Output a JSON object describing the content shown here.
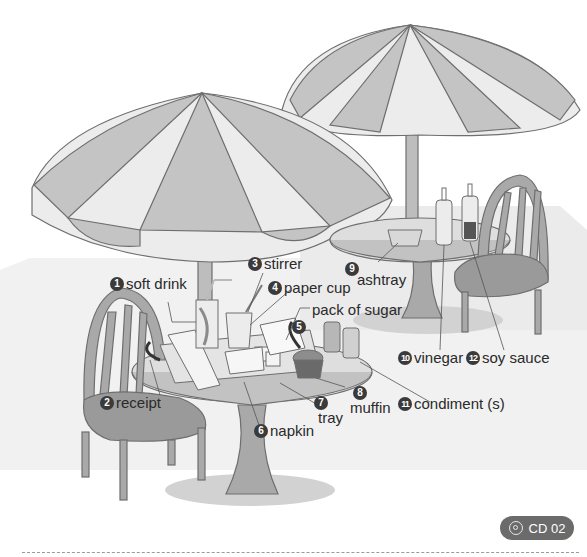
{
  "illustration": {
    "subject": "outdoor cafe tables with umbrellas",
    "colors": {
      "umbrella_dark": "#c4c4c4",
      "umbrella_light": "#ececec",
      "outline": "#6e6e6e",
      "furniture": "#a9a9a9",
      "seat": "#9a9a9a",
      "ground_band": "#eeeeee",
      "shadow": "#cfcfcf",
      "badge": "#6b6b6b"
    }
  },
  "labels": [
    {
      "number": "1",
      "text": "soft drink"
    },
    {
      "number": "2",
      "text": "receipt"
    },
    {
      "number": "3",
      "text": "stirrer"
    },
    {
      "number": "4",
      "text": "paper cup"
    },
    {
      "number": "5",
      "text": "pack of sugar"
    },
    {
      "number": "6",
      "text": "napkin"
    },
    {
      "number": "7",
      "text": "tray"
    },
    {
      "number": "8",
      "text": "muffin"
    },
    {
      "number": "9",
      "text": "ashtray"
    },
    {
      "number": "10",
      "text": "vinegar"
    },
    {
      "number": "11",
      "text": "condiment (s)"
    },
    {
      "number": "12",
      "text": "soy sauce"
    }
  ],
  "audio_badge": {
    "icon": "cd-icon",
    "text": "CD 02"
  }
}
